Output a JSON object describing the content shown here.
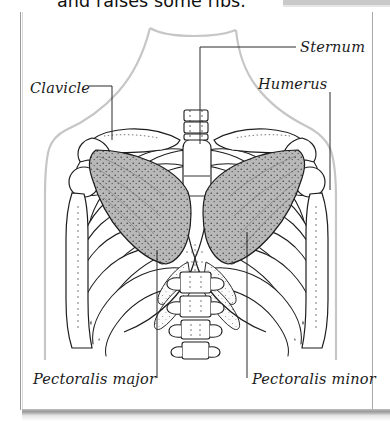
{
  "page": {
    "cut_off_text": "and raises some ribs.",
    "background_color": "#ffffff",
    "border_color": "#9b9b9b",
    "shadow_color": "#9a9a9a"
  },
  "figure": {
    "type": "anatomical-diagram",
    "outline_color": "#1a1a1a",
    "body_silhouette_color": "#c8c8c8",
    "pectoralis_major_fill": "#b0b0b0",
    "pectoralis_minor_fill": "#8a8a8a",
    "labels": [
      {
        "id": "clavicle",
        "text": "Clavicle",
        "x": 30,
        "y": 80
      },
      {
        "id": "sternum",
        "text": "Sternum",
        "x": 300,
        "y": 39
      },
      {
        "id": "humerus",
        "text": "Humerus",
        "x": 258,
        "y": 76
      },
      {
        "id": "pec-major",
        "text": "Pectoralis major",
        "x": 33,
        "y": 371
      },
      {
        "id": "pec-minor",
        "text": "Pectoralis minor",
        "x": 252,
        "y": 371
      }
    ],
    "structures": [
      "clavicle",
      "sternum",
      "humerus",
      "scapula",
      "ribs",
      "costal cartilage",
      "thoracic vertebrae",
      "lumbar vertebrae",
      "trachea",
      "pectoralis major",
      "pectoralis minor"
    ]
  }
}
